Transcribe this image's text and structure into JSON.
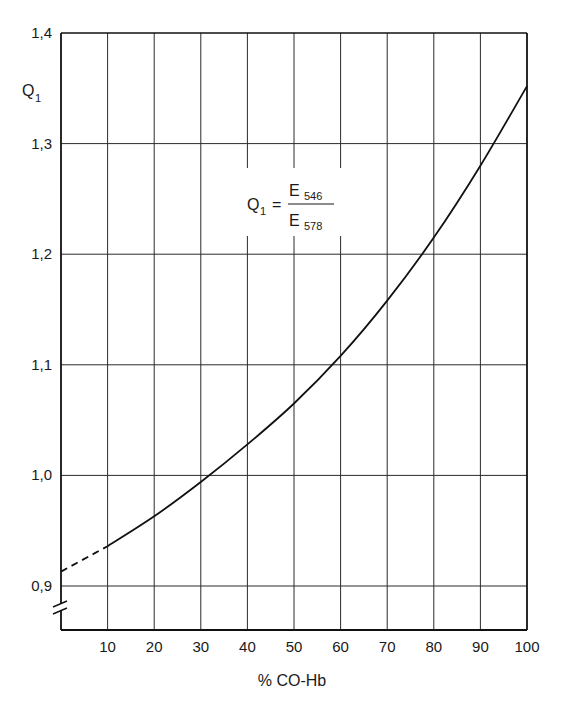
{
  "chart_data": {
    "type": "line",
    "title": "",
    "xlabel": "% CO-Hb",
    "ylabel": "Q₁",
    "ylabel_main": "Q",
    "ylabel_sub": "1",
    "annotation": {
      "lhs_main": "Q",
      "lhs_sub": "1",
      "equals": "=",
      "num_main": "E",
      "num_sub": "546",
      "den_main": "E",
      "den_sub": "578",
      "text": "Q1 = E546 / E578"
    },
    "xlim": [
      0,
      100
    ],
    "ylim": [
      0.86,
      1.4
    ],
    "x_ticks": [
      "10",
      "20",
      "30",
      "40",
      "50",
      "60",
      "70",
      "80",
      "90",
      "100"
    ],
    "x_tick_values": [
      10,
      20,
      30,
      40,
      50,
      60,
      70,
      80,
      90,
      100
    ],
    "y_ticks": [
      "0,9",
      "1,0",
      "1,1",
      "1,2",
      "1,3",
      "1,4"
    ],
    "y_tick_values": [
      0.9,
      1.0,
      1.1,
      1.2,
      1.3,
      1.4
    ],
    "axis_break": true,
    "grid": true,
    "series": [
      {
        "name": "Q1 (extrapolated)",
        "style": "dashed",
        "x": [
          0,
          10
        ],
        "y": [
          0.913,
          0.936
        ]
      },
      {
        "name": "Q1",
        "style": "solid",
        "x": [
          10,
          20,
          30,
          40,
          50,
          60,
          70,
          80,
          90,
          100
        ],
        "y": [
          0.936,
          0.963,
          0.994,
          1.028,
          1.065,
          1.108,
          1.158,
          1.215,
          1.28,
          1.352
        ]
      }
    ]
  }
}
